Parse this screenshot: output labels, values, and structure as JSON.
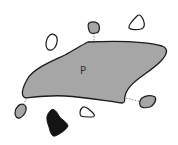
{
  "diagram": {
    "main_shape": {
      "label": "P",
      "fill": "#a6a6a6",
      "stroke": "#1a1a1a"
    },
    "colors": {
      "gray_fill": "#a6a6a6",
      "white_fill": "#ffffff",
      "black_fill": "#141414",
      "outline": "#1a1a1a",
      "connector": "#888888"
    },
    "shapes": [
      {
        "id": "top-gray",
        "type": "gray-obstacle",
        "connected": true
      },
      {
        "id": "top-right-white",
        "type": "white-obstacle",
        "connected": false
      },
      {
        "id": "left-white",
        "type": "white-obstacle",
        "connected": false
      },
      {
        "id": "right-gray",
        "type": "gray-obstacle",
        "connected": true
      },
      {
        "id": "bottom-left-gray",
        "type": "gray-obstacle",
        "connected": true
      },
      {
        "id": "bottom-black",
        "type": "black-obstacle",
        "connected": false
      },
      {
        "id": "bottom-white",
        "type": "white-obstacle",
        "connected": false
      }
    ]
  }
}
